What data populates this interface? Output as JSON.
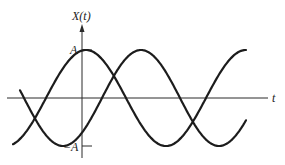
{
  "diagram": {
    "type": "signal-plot",
    "y_axis_label": "X(t)",
    "x_axis_label": "t",
    "amplitude_top_label": "A",
    "amplitude_bottom_label": "−A",
    "curves": [
      {
        "name": "waveform-1",
        "description": "sinusoid peaking at t=0 (cosine-like)"
      },
      {
        "name": "waveform-2",
        "description": "phase-shifted sinusoid"
      }
    ],
    "colors": {
      "ink": "#1c1c1c",
      "background": "#ffffff"
    }
  }
}
